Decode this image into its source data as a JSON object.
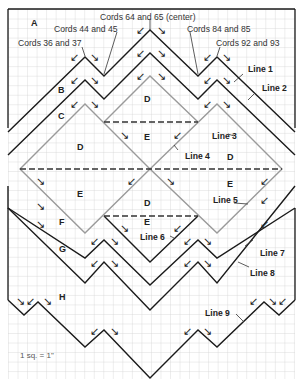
{
  "diagram": {
    "scale_label": "1 sq. = 1\"",
    "grid": {
      "cell_px": 9.53,
      "color": "#c8c8c8"
    },
    "colors": {
      "line": "#1a1a1a",
      "diamond": "#9a9a9a",
      "dashed": "#333333",
      "text": "#222222"
    },
    "cord_labels": [
      {
        "text": "Cords 64 and 65 (center)"
      },
      {
        "text": "Cords 44 and 45"
      },
      {
        "text": "Cords 84 and 85"
      },
      {
        "text": "Cords 36 and 37"
      },
      {
        "text": "Cords 92 and 93"
      }
    ],
    "line_labels": [
      {
        "text": "Line 1"
      },
      {
        "text": "Line 2"
      },
      {
        "text": "Line 3"
      },
      {
        "text": "Line 4"
      },
      {
        "text": "Line 5"
      },
      {
        "text": "Line 6"
      },
      {
        "text": "Line 7"
      },
      {
        "text": "Line 8"
      },
      {
        "text": "Line 9"
      }
    ],
    "section_labels": [
      "A",
      "B",
      "C",
      "D",
      "E",
      "D",
      "E",
      "D",
      "E",
      "E",
      "F",
      "G",
      "H",
      "D",
      "E"
    ]
  }
}
